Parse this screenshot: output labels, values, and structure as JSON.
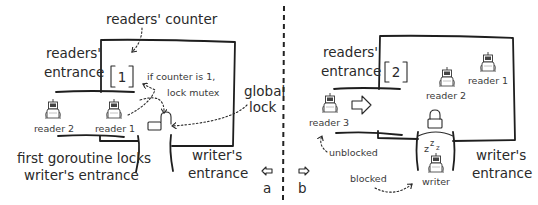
{
  "panel_a": {
    "readers_counter_label": "readers' counter",
    "readers_entrance_line1": "readers'",
    "readers_entrance_line2": "entrance",
    "counter_value": "1",
    "note_line1": "if counter is 1,",
    "note_line2": "lock mutex",
    "global_lock_line1": "global",
    "global_lock_line2": "lock",
    "readers": [
      {
        "label": "reader 2"
      },
      {
        "label": "reader 1"
      }
    ],
    "caption_line1": "first goroutine locks",
    "caption_line2": "writer's entrance",
    "writers_entrance_line1": "writer's",
    "writers_entrance_line2": "entrance",
    "panel_label": "a",
    "nav_arrow": "left-arrow",
    "lock_state": "unlocked"
  },
  "panel_b": {
    "readers_entrance_line1": "readers'",
    "readers_entrance_line2": "entrance",
    "counter_value": "2",
    "readers": [
      {
        "label": "reader 1"
      },
      {
        "label": "reader 2"
      },
      {
        "label": "reader 3"
      }
    ],
    "writer_label": "writer",
    "sleep_symbol": "z z z",
    "unblocked_label": "unblocked",
    "blocked_label": "blocked",
    "writers_entrance_line1": "writer's",
    "writers_entrance_line2": "entrance",
    "panel_label": "b",
    "nav_arrow": "right-arrow",
    "lock_state": "locked"
  },
  "colors": {
    "ink": "#1e1e1e",
    "background": "#ffffff"
  }
}
